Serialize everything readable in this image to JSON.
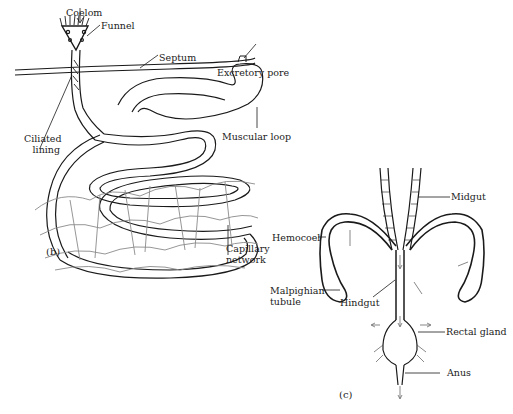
{
  "panels": {
    "b": {
      "tag": "(b)",
      "labels": {
        "coelom": "Coelom",
        "funnel": "Funnel",
        "septum": "Septum",
        "excretory_pore": "Excretory pore",
        "ciliated_lining_1": "Ciliated",
        "ciliated_lining_2": "lining",
        "muscular_loop": "Muscular loop",
        "capillary_network_1": "Capillary",
        "capillary_network_2": "network"
      }
    },
    "c": {
      "tag": "(c)",
      "labels": {
        "midgut": "Midgut",
        "hemocoel": "Hemocoel",
        "malpighian_tubule_1": "Malpighian",
        "malpighian_tubule_2": "tubule",
        "hindgut": "Hindgut",
        "rectal_gland": "Rectal gland",
        "anus": "Anus"
      }
    }
  },
  "colors": {
    "ink": "#1a1a1a",
    "capillary": "#8a8a8a",
    "background": "#ffffff"
  }
}
